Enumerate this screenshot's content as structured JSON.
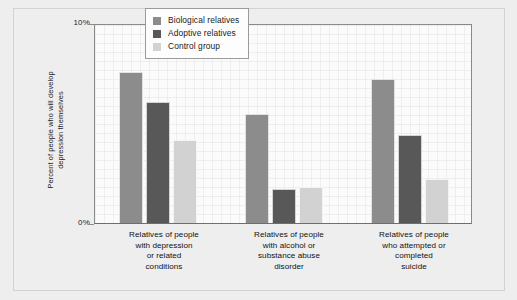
{
  "chart_data": {
    "type": "bar",
    "title": "",
    "subtitle": "",
    "xlabel": "",
    "ylabel": "Percent of people who will develop\ndepression themselves",
    "ylim": [
      0,
      10
    ],
    "yunit": "%",
    "ytick_labels": [
      "0%",
      "10%"
    ],
    "grid": true,
    "legend_position": "top-center",
    "categories": [
      "Relatives of people\nwith depression\nor related\nconditions",
      "Relatives of people\nwith alcohol or\nsubstance abuse\ndisorder",
      "Relatives of people\nwho attempted or\ncompleted\nsuicide"
    ],
    "series": [
      {
        "name": "Biological relatives",
        "color": "#8c8c8c",
        "values": [
          7.55,
          5.45,
          7.2
        ]
      },
      {
        "name": "Adoptive relatives",
        "color": "#585858",
        "values": [
          6.05,
          1.7,
          4.4
        ]
      },
      {
        "name": "Control group",
        "color": "#d2d2d2",
        "values": [
          4.15,
          1.8,
          2.2
        ]
      }
    ]
  },
  "axis": {
    "y_top_label": "10%",
    "y_bottom_label": "0%",
    "y_title": "Percent of people who will develop\ndepression themselves"
  },
  "legend": {
    "items": [
      {
        "label": "Biological relatives",
        "color": "#8c8c8c"
      },
      {
        "label": "Adoptive relatives",
        "color": "#585858"
      },
      {
        "label": "Control group",
        "color": "#d2d2d2"
      }
    ]
  },
  "colors": {
    "figure_background": "#eeeeee",
    "plot_background": "#fbfbfb",
    "axis_line": "#8a8a8a",
    "text": "#1a1a1a"
  }
}
